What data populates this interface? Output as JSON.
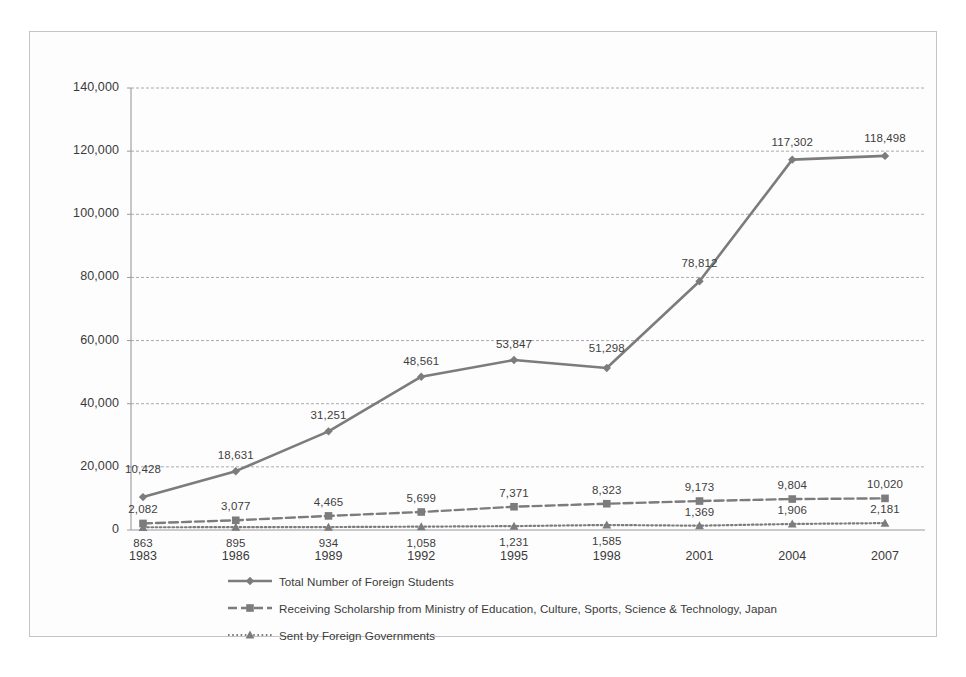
{
  "figure": {
    "background_color": "#fdfdfd",
    "frame_color": "#c4c4c8",
    "axis_color": "#9a9a9e",
    "gridline_color": "#aaaab0",
    "series_color": "#7c7c7c"
  },
  "chart_data": {
    "type": "line",
    "title": "",
    "subtitle": "",
    "xlabel": "",
    "ylabel": "",
    "x": [
      "1983",
      "1986",
      "1989",
      "1992",
      "1995",
      "1998",
      "2001",
      "2004",
      "2007"
    ],
    "categories": [
      "1983",
      "1986",
      "1989",
      "1992",
      "1995",
      "1998",
      "2001",
      "2004",
      "2007"
    ],
    "ylim": [
      0,
      140000
    ],
    "ytick_labels": [
      "0",
      "20,000",
      "40,000",
      "60,000",
      "80,000",
      "100,000",
      "120,000",
      "140,000"
    ],
    "ytick_values": [
      0,
      20000,
      40000,
      60000,
      80000,
      100000,
      120000,
      140000
    ],
    "grid": true,
    "legend_position": "bottom-left",
    "series": [
      {
        "name": "Total Number of Foreign Students",
        "marker": "diamond",
        "line_style": "solid",
        "color": "#7c7c7c",
        "values": [
          10428,
          18631,
          31251,
          48561,
          53847,
          51298,
          78812,
          117302,
          118498
        ],
        "labels": [
          "10,428",
          "18,631",
          "31,251",
          "48,561",
          "53,847",
          "51,298",
          "78,812",
          "117,302",
          "118,498"
        ]
      },
      {
        "name": "Receiving Scholarship from Ministry of Education, Culture, Sports, Science & Technology, Japan",
        "marker": "square",
        "line_style": "dashed",
        "color": "#7c7c7c",
        "values": [
          2082,
          3077,
          4465,
          5699,
          7371,
          8323,
          9173,
          9804,
          10020
        ],
        "labels": [
          "2,082",
          "3,077",
          "4,465",
          "5,699",
          "7,371",
          "8,323",
          "9,173",
          "9,804",
          "10,020"
        ]
      },
      {
        "name": "Sent by Foreign Governments",
        "marker": "triangle",
        "line_style": "dotted",
        "color": "#7c7c7c",
        "values": [
          863,
          895,
          934,
          1058,
          1231,
          1585,
          1369,
          1906,
          2181
        ],
        "labels": [
          "863",
          "895",
          "934",
          "1,058",
          "1,231",
          "1,585",
          "1,369",
          "1,906",
          "2,181"
        ]
      }
    ]
  },
  "legend": {
    "items": [
      {
        "label": "Total Number of Foreign Students",
        "marker": "diamond-icon",
        "style": "solid"
      },
      {
        "label": "Receiving Scholarship from Ministry of Education, Culture, Sports, Science & Technology, Japan",
        "marker": "square-icon",
        "style": "dashed"
      },
      {
        "label": "Sent by Foreign Governments",
        "marker": "triangle-icon",
        "style": "dotted"
      }
    ]
  }
}
